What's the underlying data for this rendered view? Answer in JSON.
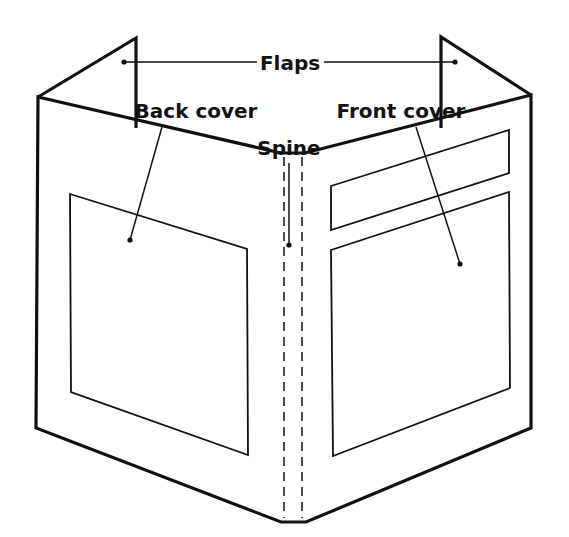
{
  "diagram": {
    "labels": {
      "flaps": "Flaps",
      "back_cover": "Back cover",
      "front_cover": "Front cover",
      "spine": "Spine"
    }
  },
  "colors": {
    "background": "#ffffff",
    "ink": "#111111"
  }
}
